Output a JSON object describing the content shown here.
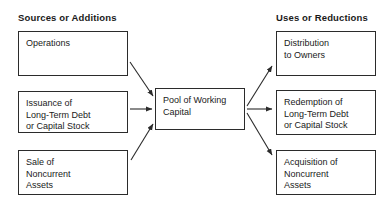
{
  "headers": {
    "left": "Sources or Additions",
    "right": "Uses or Reductions"
  },
  "nodes": {
    "operations": "Operations",
    "issuance": "Issuance of\nLong-Term Debt\nor Capital Stock",
    "sale": "Sale of\nNoncurrent\nAssets",
    "pool": "Pool of Working\nCapital",
    "distribution": "Distribution\nto Owners",
    "redemption": "Redemption of\nLong-Term Debt\nor Capital Stock",
    "acquisition": "Acquisition of\nNoncurrent\nAssets"
  },
  "colors": {
    "background": "#ffffff",
    "stroke": "#2b2b2b",
    "text": "#1a1a1a"
  }
}
